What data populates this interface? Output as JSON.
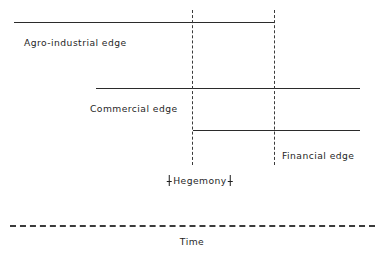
{
  "diagram": {
    "axis": {
      "label": "Time",
      "style": "dashed",
      "color": "#3a3a3a",
      "x_start": 10,
      "x_end": 375,
      "y": 225,
      "label_x": 192,
      "label_y": 236
    },
    "line_color": "#2b2b2b",
    "markers": [
      {
        "name": "hegemony-start",
        "style": "dashed",
        "x": 192,
        "y_top": 10,
        "y_bottom": 165
      },
      {
        "name": "hegemony-end",
        "style": "dashed",
        "x": 274,
        "y_top": 10,
        "y_bottom": 165
      }
    ],
    "bands": [
      {
        "id": "agro-industrial",
        "label": "Agro-industrial edge",
        "y": 22,
        "x_start": 14,
        "x_end": 275,
        "label_x": 24,
        "label_y": 37,
        "label_align": "left"
      },
      {
        "id": "commercial",
        "label": "Commercial edge",
        "y": 88,
        "x_start": 96,
        "x_end": 360,
        "label_x": 90,
        "label_y": 103,
        "label_align": "left"
      },
      {
        "id": "financial",
        "label": "Financial edge",
        "y": 130,
        "x_start": 193,
        "x_end": 360,
        "label_x": 282,
        "label_y": 150,
        "label_align": "left"
      }
    ],
    "hegemony": {
      "label": "Hegemony",
      "bracket_left": "left-bracket-icon",
      "bracket_right": "right-bracket-icon",
      "x": 200,
      "y": 175
    }
  }
}
